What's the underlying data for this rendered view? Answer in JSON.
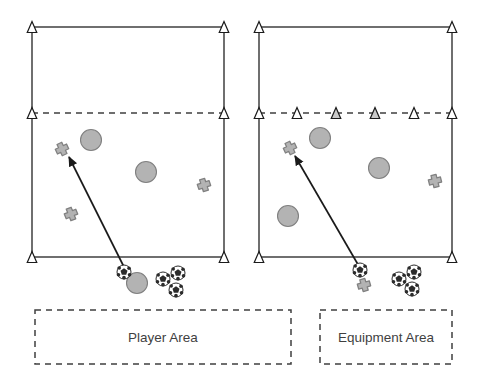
{
  "figure": {
    "title": "",
    "type": "soccer-drill-diagram",
    "panel_count": 2,
    "background_color": "#ffffff"
  },
  "palette": {
    "line": "#3f3f3f",
    "shape_fill": "#b3b3b3",
    "shape_stroke": "#808080",
    "cone_fill_empty": "#ffffff",
    "cone_fill_marked": "#c9c9c9",
    "text": "#3f3f3f",
    "ball_white": "#ffffff",
    "ball_patch": "#2b2b2b"
  },
  "panels": [
    {
      "id": "left-panel",
      "name": "player-area-panel",
      "field": {
        "x": 32,
        "y": 27,
        "width": 192,
        "height": 230,
        "corner_cones": [
          {
            "name": "cone-top-left",
            "x": 32,
            "y": 27,
            "fill": "empty"
          },
          {
            "name": "cone-top-right",
            "x": 224,
            "y": 27,
            "fill": "empty"
          },
          {
            "name": "cone-mid-left",
            "x": 32,
            "y": 113,
            "fill": "empty"
          },
          {
            "name": "cone-mid-right",
            "x": 224,
            "y": 113,
            "fill": "empty"
          },
          {
            "name": "cone-bottom-left",
            "x": 32,
            "y": 257,
            "fill": "empty"
          },
          {
            "name": "cone-bottom-right",
            "x": 224,
            "y": 257,
            "fill": "empty"
          }
        ],
        "dashed_line": {
          "y": 113,
          "x1": 32,
          "x2": 224
        },
        "dashed_line_cones": []
      },
      "players": [
        {
          "name": "player-cross",
          "x": 62,
          "y": 149,
          "rot": -25
        },
        {
          "name": "player-cross",
          "x": 71,
          "y": 214,
          "rot": -22
        }
      ],
      "players_right": [
        {
          "name": "player-cross",
          "x": 204,
          "y": 185,
          "rot": -18
        }
      ],
      "circles": [
        {
          "name": "marker-circle",
          "x": 91,
          "y": 140,
          "r": 10.5
        },
        {
          "name": "marker-circle",
          "x": 146,
          "y": 172,
          "r": 10.5
        }
      ],
      "outside": {
        "balls": [
          {
            "name": "soccer-ball",
            "x": 124,
            "y": 272,
            "r": 7
          },
          {
            "name": "soccer-ball",
            "x": 163,
            "y": 279,
            "r": 7
          },
          {
            "name": "soccer-ball",
            "x": 178,
            "y": 273,
            "r": 7
          },
          {
            "name": "soccer-ball",
            "x": 176,
            "y": 290,
            "r": 7
          }
        ],
        "circles": [
          {
            "name": "marker-circle",
            "x": 137,
            "y": 283,
            "r": 10.5
          }
        ],
        "crosses": []
      },
      "arrow": {
        "name": "movement-arrow",
        "x1": 126,
        "y1": 271,
        "x2": 69,
        "y2": 157
      },
      "label_box": {
        "name": "player-area-box",
        "x": 35,
        "y": 310,
        "width": 256,
        "height": 54,
        "text": "Player Area"
      }
    },
    {
      "id": "right-panel",
      "name": "equipment-area-panel",
      "field": {
        "x": 259,
        "y": 27,
        "width": 193,
        "height": 230,
        "corner_cones": [
          {
            "name": "cone-top-left",
            "x": 259,
            "y": 27,
            "fill": "empty"
          },
          {
            "name": "cone-top-right",
            "x": 452,
            "y": 27,
            "fill": "empty"
          },
          {
            "name": "cone-mid-left",
            "x": 259,
            "y": 113,
            "fill": "empty"
          },
          {
            "name": "cone-mid-right",
            "x": 452,
            "y": 113,
            "fill": "empty"
          },
          {
            "name": "cone-bottom-left",
            "x": 259,
            "y": 257,
            "fill": "empty"
          },
          {
            "name": "cone-bottom-right",
            "x": 452,
            "y": 257,
            "fill": "empty"
          }
        ],
        "dashed_line": {
          "y": 113,
          "x1": 259,
          "x2": 452
        },
        "dashed_line_cones": [
          {
            "name": "cone-line-1",
            "x": 297,
            "y": 113,
            "fill": "empty"
          },
          {
            "name": "cone-line-2",
            "x": 336,
            "y": 113,
            "fill": "marked"
          },
          {
            "name": "cone-line-3",
            "x": 375,
            "y": 113,
            "fill": "marked"
          },
          {
            "name": "cone-line-4",
            "x": 414,
            "y": 113,
            "fill": "empty"
          }
        ]
      },
      "players": [
        {
          "name": "player-cross",
          "x": 290,
          "y": 148,
          "rot": -25
        }
      ],
      "players_right": [
        {
          "name": "player-cross",
          "x": 435,
          "y": 181,
          "rot": -14
        }
      ],
      "circles": [
        {
          "name": "marker-circle",
          "x": 320,
          "y": 138,
          "r": 10.5
        },
        {
          "name": "marker-circle",
          "x": 379,
          "y": 168,
          "r": 10.5
        },
        {
          "name": "marker-circle",
          "x": 288,
          "y": 216,
          "r": 10.5
        }
      ],
      "outside": {
        "balls": [
          {
            "name": "soccer-ball",
            "x": 360,
            "y": 270,
            "r": 7
          },
          {
            "name": "soccer-ball",
            "x": 399,
            "y": 279,
            "r": 7
          },
          {
            "name": "soccer-ball",
            "x": 414,
            "y": 272,
            "r": 7
          },
          {
            "name": "soccer-ball",
            "x": 412,
            "y": 289,
            "r": 7
          }
        ],
        "circles": [],
        "crosses": [
          {
            "name": "equipment-cross",
            "x": 364,
            "y": 285,
            "rot": -16
          }
        ]
      },
      "arrow": {
        "name": "movement-arrow",
        "x1": 360,
        "y1": 268,
        "x2": 295,
        "y2": 156
      },
      "label_box": {
        "name": "equipment-area-box",
        "x": 320,
        "y": 310,
        "width": 132,
        "height": 54,
        "text": "Equipment Area"
      }
    }
  ],
  "labels": {
    "player_area": "Player Area",
    "equipment_area": "Equipment Area"
  }
}
